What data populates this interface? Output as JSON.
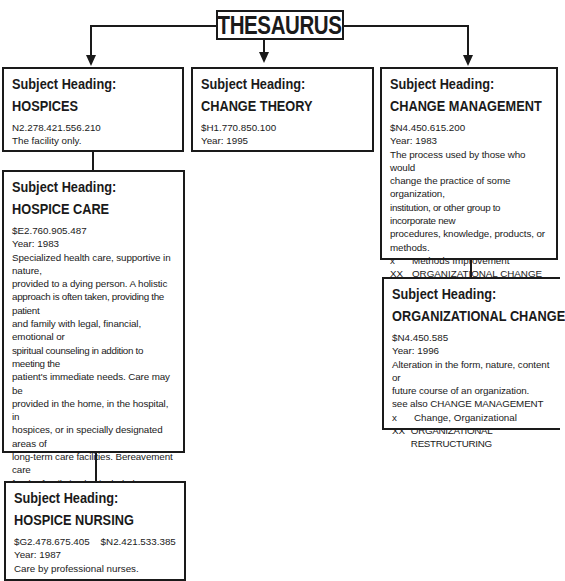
{
  "title": "THESAURUS",
  "label": "Subject Heading:",
  "cards": {
    "hospices": {
      "heading": "HOSPICES",
      "codes": "N2.278.421.556.210",
      "lines": [
        "The facility only."
      ]
    },
    "change_theory": {
      "heading": "CHANGE THEORY",
      "codes": "$H1.770.850.100",
      "year": "Year: 1995"
    },
    "change_management": {
      "heading": "CHANGE MANAGEMENT",
      "codes": "$N4.450.615.200",
      "year": "Year: 1983",
      "lines": [
        "The process used by those who would",
        "change the practice of some organization,",
        "institution, or other group to incorporate new",
        "procedures, knowledge, products, or",
        "methods."
      ],
      "refs": [
        {
          "code": "x",
          "text": "Methods Improvement"
        },
        {
          "code": "XX",
          "text": "ORGANIZATIONAL CHANGE"
        }
      ]
    },
    "hospice_care": {
      "heading": "HOSPICE CARE",
      "codes": "$E2.760.905.487",
      "year": "Year: 1983",
      "lines": [
        "Specialized health care, supportive in nature,",
        "provided to a dying person. A holistic",
        "approach is often taken, providing the patient",
        "and family with legal, financial, emotional or",
        "spiritual counseling in addition to meeting the",
        "patient's immediate needs. Care may be",
        "provided in the home, in the hospital, in",
        "hospices, or in specially designated areas of",
        "long-term care facilities. Bereavement care",
        "for the family is also included. Do not use",
        "/nursing; prefer precoordinated heading",
        "HOSPICE NURSING.",
        "see also DYING CARE (IOWA NIC)"
      ],
      "refs": [
        {
          "code": "XX",
          "text": "TERMINAL CARE"
        }
      ]
    },
    "organizational_change": {
      "heading": "ORGANIZATIONAL CHANGE",
      "codes": "$N4.450.585",
      "year": "Year: 1996",
      "lines": [
        "Alteration in the form, nature, content or",
        "future course of an organization.",
        "see also CHANGE MANAGEMENT"
      ],
      "refs": [
        {
          "code": "x",
          "text": "Change, Organizational"
        },
        {
          "code": "XX",
          "text": "ORGANIZATIONAL RESTRUCTURING"
        }
      ]
    },
    "hospice_nursing": {
      "heading": "HOSPICE NURSING",
      "codes": "$G2.478.675.405    $N2.421.533.385",
      "year": "Year: 1987",
      "lines": [
        "Care by professional nurses."
      ]
    }
  }
}
